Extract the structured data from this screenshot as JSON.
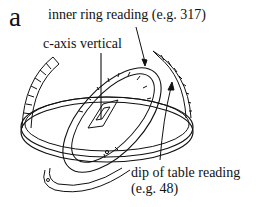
{
  "figure": {
    "panel_letter": "a",
    "labels": {
      "inner_ring": "inner ring reading (e.g. 317)",
      "c_axis": "c-axis vertical",
      "dip_line1": "dip of table reading",
      "dip_line2": "(e.g. 48)"
    },
    "example_values": {
      "inner_ring_reading": 317,
      "dip_of_table_reading": 48
    },
    "line_color": "#111111",
    "background": "#ffffff"
  }
}
